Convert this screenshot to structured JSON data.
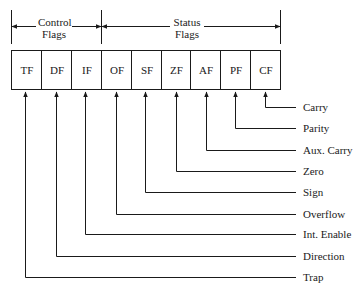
{
  "diagram": {
    "groups": [
      {
        "label_line1": "Control",
        "label_line2": "Flags"
      },
      {
        "label_line1": "Status",
        "label_line2": "Flags"
      }
    ],
    "cells": [
      "TF",
      "DF",
      "IF",
      "OF",
      "SF",
      "ZF",
      "AF",
      "PF",
      "CF"
    ],
    "descriptions": [
      {
        "flag": "CF",
        "label": "Carry"
      },
      {
        "flag": "PF",
        "label": "Parity"
      },
      {
        "flag": "AF",
        "label": "Aux. Carry"
      },
      {
        "flag": "ZF",
        "label": "Zero"
      },
      {
        "flag": "SF",
        "label": "Sign"
      },
      {
        "flag": "OF",
        "label": "Overflow"
      },
      {
        "flag": "IF",
        "label": "Int. Enable"
      },
      {
        "flag": "DF",
        "label": "Direction"
      },
      {
        "flag": "TF",
        "label": "Trap"
      }
    ]
  }
}
